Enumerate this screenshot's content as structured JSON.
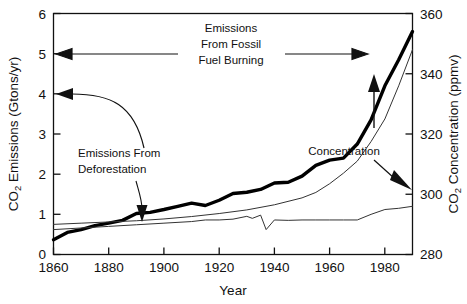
{
  "chart_data": {
    "type": "line",
    "title": "",
    "xlabel": "Year",
    "ylabel": "CO2 Emissions (Gtons/yr)",
    "y2label": "CO2 Concentration (ppmv)",
    "xlim": [
      1860,
      1990
    ],
    "ylim": [
      0,
      6
    ],
    "y2lim": [
      280,
      360
    ],
    "xticks": [
      "1860",
      "1880",
      "1900",
      "1920",
      "1940",
      "1960",
      "1980"
    ],
    "xtick_values": [
      1860,
      1880,
      1900,
      1920,
      1940,
      1960,
      1980
    ],
    "yticks": [
      "0",
      "1",
      "2",
      "3",
      "4",
      "5",
      "6"
    ],
    "ytick_values": [
      0,
      1,
      2,
      3,
      4,
      5,
      6
    ],
    "y2ticks": [
      "280",
      "300",
      "320",
      "340",
      "360"
    ],
    "y2tick_values": [
      280,
      300,
      320,
      340,
      360
    ],
    "grid": false,
    "legend_position": "none",
    "series": [
      {
        "name": "Emissions From Fossil Fuel Burning",
        "axis": "left",
        "style": "thick-black-line",
        "x": [
          1860,
          1865,
          1870,
          1875,
          1880,
          1885,
          1890,
          1895,
          1900,
          1905,
          1910,
          1915,
          1920,
          1925,
          1930,
          1935,
          1940,
          1945,
          1950,
          1955,
          1960,
          1965,
          1970,
          1975,
          1980,
          1985,
          1990
        ],
        "y": [
          0.37,
          0.55,
          0.62,
          0.72,
          0.78,
          0.85,
          1.02,
          1.05,
          1.12,
          1.2,
          1.28,
          1.22,
          1.35,
          1.52,
          1.55,
          1.62,
          1.78,
          1.8,
          1.95,
          2.22,
          2.35,
          2.4,
          2.75,
          3.35,
          4.2,
          4.85,
          5.55
        ]
      },
      {
        "name": "Emissions From Deforestation",
        "axis": "left",
        "style": "thin-black-line",
        "x": [
          1860,
          1870,
          1880,
          1890,
          1900,
          1910,
          1915,
          1920,
          1925,
          1930,
          1932,
          1935,
          1937,
          1940,
          1945,
          1950,
          1955,
          1960,
          1965,
          1970,
          1975,
          1980,
          1985,
          1990
        ],
        "y": [
          0.62,
          0.66,
          0.7,
          0.74,
          0.78,
          0.82,
          0.86,
          0.86,
          0.88,
          0.95,
          0.9,
          0.98,
          0.62,
          0.86,
          0.85,
          0.86,
          0.86,
          0.86,
          0.86,
          0.86,
          1.0,
          1.12,
          1.15,
          1.2
        ]
      },
      {
        "name": "CO2 Concentration",
        "axis": "right",
        "style": "thin-black-line",
        "x": [
          1860,
          1870,
          1880,
          1890,
          1900,
          1910,
          1920,
          1930,
          1940,
          1950,
          1955,
          1960,
          1965,
          1970,
          1975,
          1980,
          1985,
          1990
        ],
        "y": [
          290.0,
          290.4,
          290.8,
          291.2,
          291.8,
          292.6,
          293.6,
          294.8,
          296.5,
          298.8,
          300.6,
          303.5,
          307.0,
          311.0,
          317.5,
          325.0,
          336.0,
          348.0
        ]
      }
    ],
    "annotations": [
      {
        "name": "fossil-fuel-annotation",
        "text_lines": [
          "Emissions",
          "From Fossil",
          "Fuel Burning"
        ],
        "arrow": "double-headed-horizontal"
      },
      {
        "name": "deforestation-annotation",
        "text_lines": [
          "Emissions From",
          "Deforestation"
        ],
        "arrow": "leader-line-to-curve"
      },
      {
        "name": "concentration-annotation",
        "text_lines": [
          "Concentration"
        ],
        "arrow": "up-arrow-and-right-arrow"
      }
    ]
  },
  "axis": {
    "y_label_main": "CO",
    "y_label_sub": "2",
    "y_label_rest": " Emissions (Gtons/yr)",
    "y2_label_main": "CO",
    "y2_label_sub": "2",
    "y2_label_rest": " Concentration (ppmv)",
    "x_label": "Year"
  },
  "annotations": {
    "fossil_line1": "Emissions",
    "fossil_line2": "From Fossil",
    "fossil_line3": "Fuel Burning",
    "defor_line1": "Emissions From",
    "defor_line2": "Deforestation",
    "concentration": "Concentration"
  },
  "colors": {
    "ink": "#111111",
    "background": "#ffffff",
    "thick_line": "#000000",
    "thin_line": "#333333"
  }
}
